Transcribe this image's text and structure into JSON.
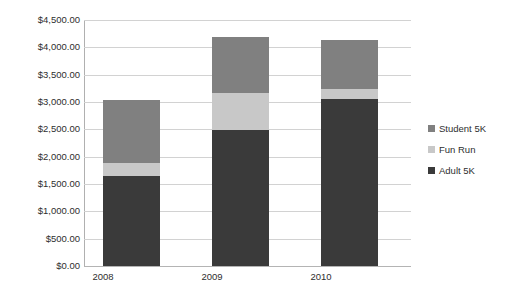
{
  "chart_data": {
    "type": "bar",
    "subtype": "stacked-column",
    "title": "",
    "subtitle": "",
    "xlabel": "",
    "ylabel": "",
    "categories": [
      "2008",
      "2009",
      "2010"
    ],
    "series": [
      {
        "name": "Adult 5K",
        "values": [
          1650,
          2480,
          3050
        ],
        "color": "#3a3a3a"
      },
      {
        "name": "Fun Run",
        "values": [
          230,
          680,
          180
        ],
        "color": "#c8c8c8"
      },
      {
        "name": "Student 5K",
        "values": [
          1150,
          1030,
          900
        ],
        "color": "#808080"
      }
    ],
    "stack_order": [
      "Adult 5K",
      "Fun Run",
      "Student 5K"
    ],
    "totals": [
      3030,
      4190,
      4130
    ],
    "ylim": [
      0,
      4500
    ],
    "ytick_step": 500,
    "ytick_labels": [
      "$0.00",
      "$500.00",
      "$1,000.00",
      "$1,500.00",
      "$2,000.00",
      "$2,500.00",
      "$3,000.00",
      "$3,500.00",
      "$4,000.00",
      "$4,500.00"
    ],
    "ytick_values": [
      0,
      500,
      1000,
      1500,
      2000,
      2500,
      3000,
      3500,
      4000,
      4500
    ],
    "grid": {
      "horizontal": true,
      "vertical": false
    },
    "legend": {
      "position": "right",
      "entries": [
        "Student 5K",
        "Fun Run",
        "Adult 5K"
      ]
    },
    "value_labels_shown": false,
    "currency_prefix": "$"
  },
  "axis": {
    "y": {
      "ticks": [
        {
          "label": "$4,500.00",
          "value": 4500
        },
        {
          "label": "$4,000.00",
          "value": 4000
        },
        {
          "label": "$3,500.00",
          "value": 3500
        },
        {
          "label": "$3,000.00",
          "value": 3000
        },
        {
          "label": "$2,500.00",
          "value": 2500
        },
        {
          "label": "$2,000.00",
          "value": 2000
        },
        {
          "label": "$1,500.00",
          "value": 1500
        },
        {
          "label": "$1,000.00",
          "value": 1000
        },
        {
          "label": "$500.00",
          "value": 500
        },
        {
          "label": "$0.00",
          "value": 0
        }
      ]
    },
    "x": {
      "ticks": [
        {
          "label": "2008"
        },
        {
          "label": "2009"
        },
        {
          "label": "2010"
        }
      ]
    }
  },
  "legend": {
    "items": [
      {
        "label": "Student 5K",
        "color": "#808080"
      },
      {
        "label": "Fun Run",
        "color": "#c8c8c8"
      },
      {
        "label": "Adult 5K",
        "color": "#3a3a3a"
      }
    ]
  },
  "colors": {
    "adult_5k": "#3a3a3a",
    "fun_run": "#c8c8c8",
    "student_5k": "#808080",
    "gridline": "#d2d2d2",
    "axis": "#b0b0b0",
    "text": "#2e2e2e",
    "background": "#ffffff"
  }
}
